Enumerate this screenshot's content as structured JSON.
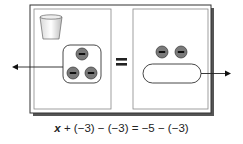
{
  "diagram": {
    "left_panel": {
      "label": "x",
      "items": [
        "cup"
      ],
      "grouped_tiles": [
        "-",
        "-",
        "-"
      ],
      "group_arrow": "left"
    },
    "equals_symbol": "=",
    "right_panel": {
      "loose_tiles": [
        "-",
        "-"
      ],
      "grouped_tiles": [
        "-",
        "-",
        "-"
      ],
      "group_arrow": "right"
    },
    "tile_symbol": "−",
    "colors": {
      "tile": "#7a7a7a",
      "frame_shadow": "#444444"
    }
  },
  "equation": {
    "variable": "x",
    "rest": " + (−3) − (−3) = −5 − (−3)"
  }
}
